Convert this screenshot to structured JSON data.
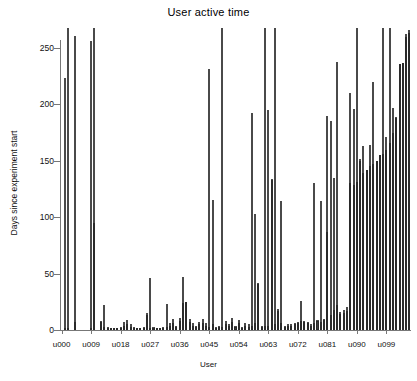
{
  "chart_data": {
    "type": "bar",
    "title": "User active time",
    "xlabel": "User",
    "ylabel": "Days since experiment start",
    "ylim": [
      0,
      270
    ],
    "yticks": [
      0,
      50,
      100,
      150,
      200,
      250
    ],
    "ytick_labels": [
      "0",
      "50",
      "100",
      "150",
      "200",
      "250"
    ],
    "xtick_labels": [
      "u000",
      "u009",
      "u018",
      "u027",
      "u036",
      "u045",
      "u054",
      "u063",
      "u072",
      "u081",
      "u090",
      "u099"
    ],
    "xtick_indices": [
      0,
      9,
      18,
      27,
      36,
      45,
      54,
      63,
      72,
      81,
      90,
      99
    ],
    "grid": false,
    "legend": "none",
    "orientation": "vertical",
    "bar_style": "overlapping",
    "colors": {
      "total_bar_fill": "#ffffff",
      "total_bar_edge": "#4a4a4a",
      "active_bar_fill": "#3b3b3b",
      "active_bar_edge": "#2a2a2a",
      "axis": "#777777",
      "text": "#111111",
      "background": "#ffffff"
    },
    "categories": [
      "u000",
      "u001",
      "u002",
      "u003",
      "u004",
      "u005",
      "u006",
      "u007",
      "u008",
      "u009",
      "u010",
      "u011",
      "u012",
      "u013",
      "u014",
      "u015",
      "u016",
      "u017",
      "u018",
      "u019",
      "u020",
      "u021",
      "u022",
      "u023",
      "u024",
      "u025",
      "u026",
      "u027",
      "u028",
      "u029",
      "u030",
      "u031",
      "u032",
      "u033",
      "u034",
      "u035",
      "u036",
      "u037",
      "u038",
      "u039",
      "u040",
      "u041",
      "u042",
      "u043",
      "u044",
      "u045",
      "u046",
      "u047",
      "u048",
      "u049",
      "u050",
      "u051",
      "u052",
      "u053",
      "u054",
      "u055",
      "u056",
      "u057",
      "u058",
      "u059",
      "u060",
      "u061",
      "u062",
      "u063",
      "u064",
      "u065",
      "u066",
      "u067",
      "u068",
      "u069",
      "u070",
      "u071",
      "u072",
      "u073",
      "u074",
      "u075",
      "u076",
      "u077",
      "u078",
      "u079",
      "u080",
      "u081",
      "u082",
      "u083",
      "u084",
      "u085",
      "u086",
      "u087",
      "u088",
      "u089",
      "u090",
      "u091",
      "u092",
      "u093",
      "u094",
      "u095",
      "u096",
      "u097",
      "u098",
      "u099",
      "u100",
      "u101",
      "u102",
      "u103",
      "u104",
      "u105",
      "u106"
    ],
    "series": [
      {
        "name": "Total span since experiment start",
        "style": "white-outlined",
        "values": [
          0,
          223,
          268,
          0,
          261,
          0,
          0,
          0,
          0,
          256,
          268,
          0,
          8,
          22,
          3,
          1,
          2,
          2,
          3,
          7,
          9,
          5,
          3,
          2,
          2,
          3,
          15,
          46,
          3,
          2,
          2,
          3,
          23,
          6,
          10,
          4,
          11,
          47,
          25,
          10,
          6,
          4,
          7,
          10,
          6,
          231,
          115,
          3,
          4,
          268,
          8,
          5,
          11,
          4,
          9,
          3,
          6,
          5,
          192,
          103,
          42,
          4,
          268,
          195,
          134,
          268,
          19,
          114,
          4,
          5,
          5,
          6,
          7,
          26,
          8,
          7,
          5,
          130,
          9,
          114,
          10,
          190,
          185,
          135,
          238,
          16,
          18,
          20,
          210,
          196,
          268,
          152,
          163,
          26,
          164,
          220,
          30,
          33,
          268,
          171,
          268,
          197,
          189,
          40,
          45,
          262,
          266
        ]
      },
      {
        "name": "Active days",
        "style": "dark-filled",
        "values": [
          0,
          1,
          2,
          0,
          7,
          0,
          0,
          0,
          0,
          2,
          95,
          0,
          7,
          3,
          2,
          1,
          1,
          1,
          2,
          4,
          5,
          3,
          2,
          1,
          1,
          2,
          13,
          2,
          2,
          1,
          1,
          2,
          3,
          4,
          6,
          3,
          8,
          24,
          25,
          7,
          4,
          3,
          5,
          6,
          4,
          3,
          5,
          2,
          3,
          3,
          5,
          4,
          7,
          3,
          6,
          2,
          4,
          3,
          4,
          6,
          41,
          3,
          4,
          4,
          133,
          5,
          17,
          6,
          3,
          4,
          4,
          5,
          6,
          8,
          7,
          6,
          4,
          6,
          8,
          7,
          9,
          87,
          13,
          18,
          22,
          14,
          15,
          17,
          130,
          129,
          131,
          150,
          139,
          142,
          145,
          147,
          150,
          155,
          156,
          160,
          166,
          175,
          188,
          236,
          237,
          260,
          263
        ]
      }
    ]
  }
}
